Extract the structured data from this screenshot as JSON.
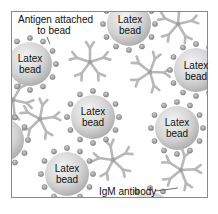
{
  "diagram": {
    "labels": {
      "antigen": "Antigen attached to bead",
      "antigen_line1": "Antigen attached",
      "antigen_line2": "to bead",
      "igm": "IgM antibody"
    },
    "colors": {
      "frame": "#888888",
      "bead_light": "#f2f2f2",
      "bead_dark": "#a8a8a8",
      "antigen_fill": "#9a9a9a",
      "antibody": "#b8b8b8"
    },
    "beads": [
      {
        "label_line1": "Latex",
        "label_line2": "bead",
        "cx": 30,
        "cy": 64
      },
      {
        "label_line1": "Latex",
        "label_line2": "bead",
        "cx": 129,
        "cy": 24
      },
      {
        "label_line1": "Latex",
        "label_line2": "bead",
        "cx": 196,
        "cy": 70
      },
      {
        "label_line1": "Latex",
        "label_line2": "bead",
        "cx": 93,
        "cy": 117
      },
      {
        "label_line1": "Latex",
        "label_line2": "bead",
        "cx": 177,
        "cy": 128
      },
      {
        "label_line1": "Latex",
        "label_line2": "bead",
        "cx": 67,
        "cy": 174
      }
    ]
  }
}
